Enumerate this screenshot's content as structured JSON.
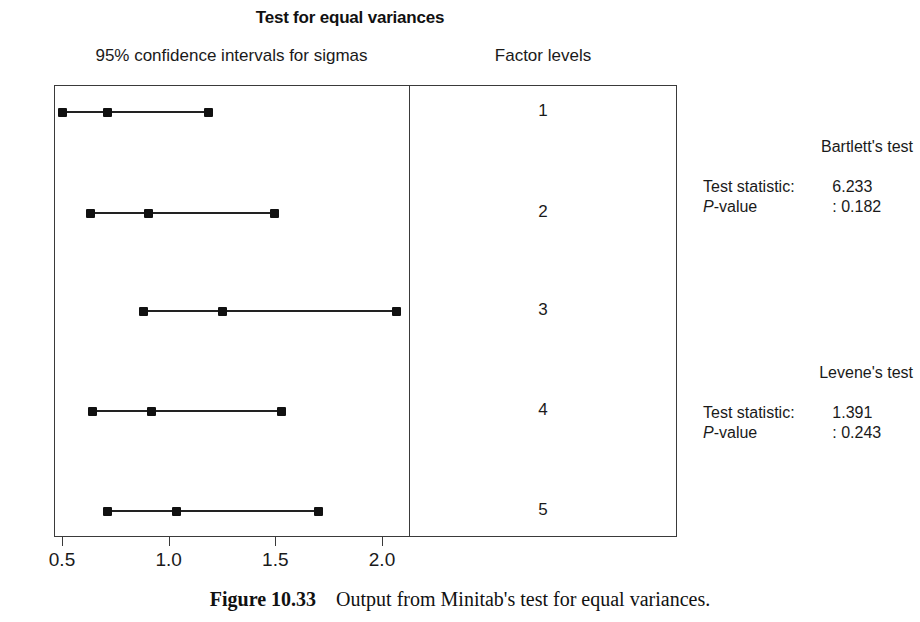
{
  "title": "Test for equal variances",
  "headers": {
    "left": "95% confidence intervals for sigmas",
    "right": "Factor levels"
  },
  "caption": {
    "label": "Figure 10.33",
    "text": "Output from Minitab's test for equal variances."
  },
  "tests": [
    {
      "name": "Bartlett's test",
      "statistic_label": "Test statistic:",
      "statistic_value": "6.233",
      "pvalue_label_italic": "P",
      "pvalue_label_rest": "-value",
      "pvalue_value": ": 0.182"
    },
    {
      "name": "Levene's test",
      "statistic_label": "Test statistic:",
      "statistic_value": "1.391",
      "pvalue_label_italic": "P",
      "pvalue_label_rest": "-value",
      "pvalue_value": ": 0.243"
    }
  ],
  "chart_data": {
    "type": "scatter",
    "subtype": "confidence-interval-plot",
    "title": "Test for equal variances",
    "xlabel": "",
    "ylabel": "Factor levels",
    "xlim": [
      0.38,
      2.16
    ],
    "xticks": [
      0.5,
      1.0,
      1.5,
      2.0
    ],
    "xticklabels": [
      "0.5",
      "1.0",
      "1.5",
      "2.0"
    ],
    "grid": false,
    "legend": null,
    "categories": [
      "1",
      "2",
      "3",
      "4",
      "5"
    ],
    "series": [
      {
        "name": "lower",
        "values": [
          0.5,
          0.632,
          0.88,
          0.645,
          0.715
        ]
      },
      {
        "name": "center",
        "values": [
          0.715,
          0.905,
          1.25,
          0.92,
          1.035
        ]
      },
      {
        "name": "upper",
        "values": [
          1.185,
          1.495,
          2.07,
          1.53,
          1.7
        ]
      }
    ],
    "intervals": [
      {
        "level": "1",
        "lower": 0.5,
        "center": 0.715,
        "upper": 1.185
      },
      {
        "level": "2",
        "lower": 0.632,
        "center": 0.905,
        "upper": 1.495
      },
      {
        "level": "3",
        "lower": 0.88,
        "center": 1.25,
        "upper": 2.07
      },
      {
        "level": "4",
        "lower": 0.645,
        "center": 0.92,
        "upper": 1.53
      },
      {
        "level": "5",
        "lower": 0.715,
        "center": 1.035,
        "upper": 1.7
      }
    ],
    "annotations": [
      "Bartlett's test  Test statistic: 6.233  P-value : 0.182",
      "Levene's test  Test statistic: 1.391  P-value : 0.243"
    ]
  },
  "colors": {
    "marker": "#111111",
    "line": "#222222",
    "frame": "#3a3a3a",
    "text": "#1a1a1a",
    "background": "#ffffff"
  }
}
